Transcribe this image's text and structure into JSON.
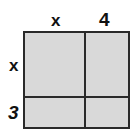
{
  "diagram": {
    "type": "area-model",
    "top_labels": [
      "x",
      "4"
    ],
    "side_labels": [
      "x",
      "3"
    ],
    "fill_color": "#d9d9d9",
    "line_color": "#2a2a2a"
  }
}
